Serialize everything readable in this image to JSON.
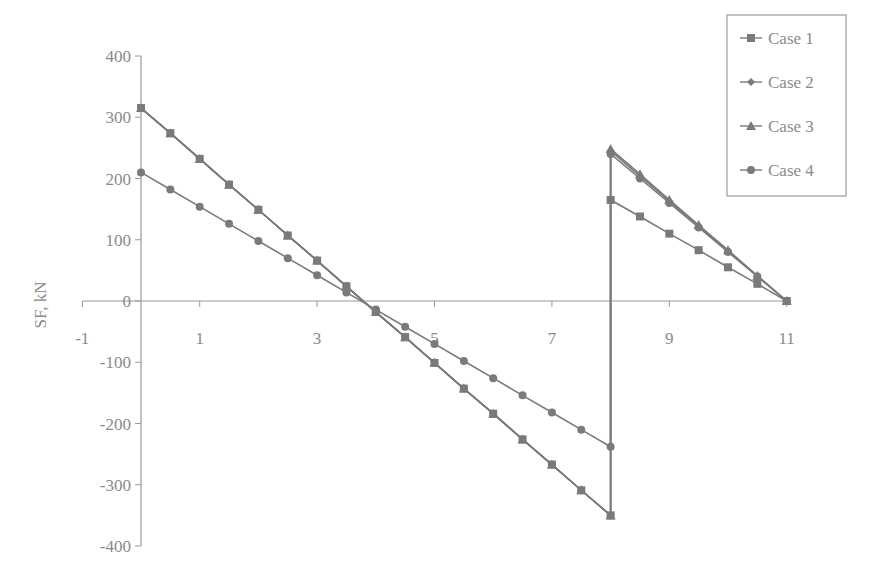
{
  "chart_data": {
    "type": "line",
    "title": "",
    "xlabel": "",
    "ylabel": "SF, kN",
    "xlim": [
      -1,
      11
    ],
    "ylim": [
      -400,
      400
    ],
    "x_ticks": [
      -1,
      1,
      3,
      5,
      7,
      9,
      11
    ],
    "y_ticks": [
      400,
      300,
      200,
      100,
      0,
      -100,
      -200,
      -300,
      -400
    ],
    "grid": false,
    "legend_position": "top-right",
    "series_assignment_note": "Two line groups were clearly visible, but marker shapes could not be resolved at this resolution, so the mapping of Case 1-4 to each group is inferred and may be mislabeled.",
    "series": [
      {
        "name": "Case 1",
        "marker": "square",
        "x": [
          0,
          0.5,
          1,
          1.5,
          2,
          2.5,
          3,
          3.5,
          4,
          4.5,
          5,
          5.5,
          6,
          6.5,
          7,
          7.5,
          8,
          8,
          8.5,
          9,
          9.5,
          10,
          10.5,
          11
        ],
        "values": [
          315,
          274,
          232,
          190,
          149,
          107,
          66,
          24,
          -18,
          -59,
          -101,
          -143,
          -184,
          -226,
          -267,
          -309,
          -350,
          165,
          138,
          110,
          83,
          55,
          28,
          0
        ]
      },
      {
        "name": "Case 2",
        "marker": "diamond",
        "x": [
          0,
          0.5,
          1,
          1.5,
          2,
          2.5,
          3,
          3.5,
          4,
          4.5,
          5,
          5.5,
          6,
          6.5,
          7,
          7.5,
          8,
          8,
          8.5,
          9,
          9.5,
          10,
          10.5,
          11
        ],
        "values": [
          315,
          274,
          232,
          190,
          149,
          107,
          66,
          24,
          -18,
          -59,
          -101,
          -143,
          -184,
          -226,
          -267,
          -309,
          -350,
          245,
          204,
          163,
          122,
          82,
          41,
          0
        ]
      },
      {
        "name": "Case 3",
        "marker": "triangle",
        "x": [
          0,
          0.5,
          1,
          1.5,
          2,
          2.5,
          3,
          3.5,
          4,
          4.5,
          5,
          5.5,
          6,
          6.5,
          7,
          7.5,
          8,
          8,
          8.5,
          9,
          9.5,
          10,
          10.5,
          11
        ],
        "values": [
          315,
          274,
          232,
          190,
          149,
          107,
          66,
          24,
          -18,
          -59,
          -101,
          -143,
          -184,
          -226,
          -267,
          -309,
          -350,
          248,
          207,
          165,
          124,
          83,
          41,
          0
        ]
      },
      {
        "name": "Case 4",
        "marker": "circle",
        "x": [
          0,
          0.5,
          1,
          1.5,
          2,
          2.5,
          3,
          3.5,
          4,
          4.5,
          5,
          5.5,
          6,
          6.5,
          7,
          7.5,
          8,
          8,
          8.5,
          9,
          9.5,
          10,
          10.5,
          11
        ],
        "values": [
          210,
          182,
          154,
          126,
          98,
          70,
          42,
          14,
          -14,
          -42,
          -70,
          -98,
          -126,
          -154,
          -182,
          -210,
          -238,
          240,
          200,
          160,
          120,
          80,
          40,
          0
        ]
      }
    ]
  },
  "legend": {
    "items": [
      "Case 1",
      "Case 2",
      "Case 3",
      "Case 4"
    ]
  },
  "colors": {
    "line": "#7a7a7a",
    "text": "#8a8a8a",
    "axis": "#999999"
  }
}
